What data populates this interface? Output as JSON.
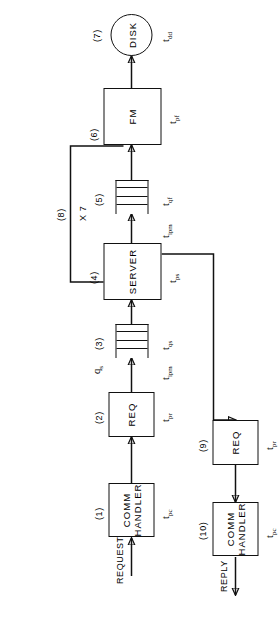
{
  "figure": {
    "orientation_degrees": -90,
    "nodes": [
      {
        "id": "comm1",
        "tag": "(1)",
        "label_line1": "COMM",
        "label_line2": "HANDLER",
        "time": "t",
        "time_sub": "pc",
        "shape": "box"
      },
      {
        "id": "req2",
        "tag": "(2)",
        "label_line1": "REQ",
        "label_line2": "",
        "time": "t",
        "time_sub": "pr",
        "shape": "box"
      },
      {
        "id": "queue3",
        "tag": "(3)",
        "label_line1": "",
        "label_line2": "",
        "time": "t",
        "time_sub": "qs",
        "shape": "queue"
      },
      {
        "id": "server4",
        "tag": "(4)",
        "label_line1": "SERVER",
        "label_line2": "",
        "time": "t",
        "time_sub": "ps",
        "shape": "box"
      },
      {
        "id": "queue5",
        "tag": "(5)",
        "label_line1": "",
        "label_line2": "",
        "time": "t",
        "time_sub": "qf",
        "shape": "queue"
      },
      {
        "id": "fm6",
        "tag": "(6)",
        "label_line1": "FM",
        "label_line2": "",
        "time": "t",
        "time_sub": "pf",
        "shape": "box"
      },
      {
        "id": "disk7",
        "tag": "(7)",
        "label_line1": "DISK",
        "label_line2": "",
        "time": "t",
        "time_sub": "dd",
        "shape": "ellipse"
      },
      {
        "id": "req9",
        "tag": "(9)",
        "label_line1": "REQ",
        "label_line2": "",
        "time": "t",
        "time_sub": "pr",
        "shape": "box"
      },
      {
        "id": "comm10",
        "tag": "(10)",
        "label_line1": "COMM",
        "label_line2": "HANDLER",
        "time": "t",
        "time_sub": "pc",
        "shape": "box"
      }
    ],
    "annotations": {
      "request_label": "REQUEST",
      "reply_label": "REPLY",
      "queue_length": "q",
      "queue_length_sub": "s",
      "ipm_label": "t",
      "ipm_sub": "ipm",
      "ipm_label2": "t",
      "ipm_sub2": "ipm",
      "feedback_tag": "(8)",
      "feedback_multiplier": "X 7"
    },
    "colors": {
      "stroke": "#111111",
      "fill": "#ffffff",
      "text": "#000000"
    }
  }
}
